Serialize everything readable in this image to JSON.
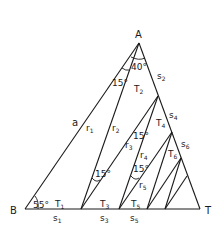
{
  "figure": {
    "vertices": {
      "A": "A",
      "B": "B",
      "T": "T"
    },
    "side_label": "a",
    "angles": {
      "apex": "40°",
      "base_left": "55°",
      "a1": "15°",
      "a2": "15°",
      "a3": "15°",
      "a4": "15°"
    },
    "rays": [
      {
        "base": "r",
        "sub": "1"
      },
      {
        "base": "r",
        "sub": "2"
      },
      {
        "base": "r",
        "sub": "3"
      },
      {
        "base": "r",
        "sub": "4"
      },
      {
        "base": "r",
        "sub": "5"
      }
    ],
    "triangles": [
      {
        "base": "T",
        "sub": "1"
      },
      {
        "base": "T",
        "sub": "2"
      },
      {
        "base": "T",
        "sub": "3"
      },
      {
        "base": "T",
        "sub": "4"
      },
      {
        "base": "T",
        "sub": "5"
      },
      {
        "base": "T",
        "sub": "6"
      }
    ],
    "segments": [
      {
        "base": "s",
        "sub": "1"
      },
      {
        "base": "s",
        "sub": "2"
      },
      {
        "base": "s",
        "sub": "3"
      },
      {
        "base": "s",
        "sub": "4"
      },
      {
        "base": "s",
        "sub": "5"
      },
      {
        "base": "s",
        "sub": "6"
      }
    ]
  }
}
